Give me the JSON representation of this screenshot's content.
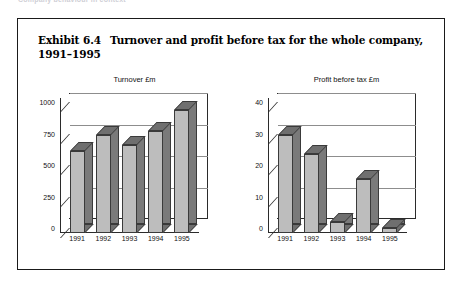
{
  "page": {
    "running_head": "Company behaviour in context",
    "exhibit_label": "Exhibit 6.4",
    "exhibit_title": "Turnover and profit before tax for the whole company, 1991–1995"
  },
  "chart_data": [
    {
      "type": "bar",
      "title": "Turnover £m",
      "categories": [
        "1991",
        "1992",
        "1993",
        "1994",
        "1995"
      ],
      "values": [
        650,
        780,
        700,
        810,
        980
      ],
      "xlabel": "",
      "ylabel": "",
      "ylim": [
        0,
        1000
      ],
      "yticks": [
        "0",
        "250",
        "500",
        "750",
        "1000"
      ],
      "ytick_values": [
        0,
        250,
        500,
        750,
        1000
      ],
      "grid": true,
      "legend": "none",
      "style": "3d-column"
    },
    {
      "type": "bar",
      "title": "Profit before tax £m",
      "categories": [
        "1991",
        "1992",
        "1993",
        "1994",
        "1995"
      ],
      "values": [
        31,
        25,
        3.5,
        17,
        1.5
      ],
      "xlabel": "",
      "ylabel": "",
      "ylim": [
        0,
        40
      ],
      "yticks": [
        "0",
        "10",
        "20",
        "30",
        "40"
      ],
      "ytick_values": [
        0,
        10,
        20,
        30,
        40
      ],
      "grid": true,
      "legend": "none",
      "style": "3d-column"
    }
  ],
  "colors": {
    "bar_front": "#bdbdbd",
    "bar_shadow": "#6f6f6f",
    "outline": "#3a3a3a",
    "gridline": "#8d8d8d",
    "border": "#1a1a1a"
  }
}
